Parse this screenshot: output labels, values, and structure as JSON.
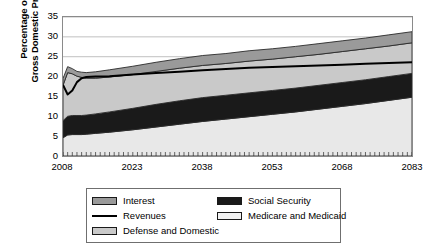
{
  "chart_data": {
    "type": "area",
    "stacked": true,
    "title": "",
    "xlabel": "",
    "ylabel": "Percentage of Gross Domestic Product",
    "ylabel_line1": "Percentage of",
    "ylabel_line2": "Gross Domestic Product",
    "xlim": [
      2008,
      2083
    ],
    "ylim": [
      0,
      35
    ],
    "yticks": [
      0,
      5,
      10,
      15,
      20,
      25,
      30,
      35
    ],
    "ytick_labels": [
      "0",
      "5",
      "10",
      "15",
      "20",
      "25",
      "30",
      "35"
    ],
    "xticks": [
      2008,
      2023,
      2038,
      2053,
      2068,
      2083
    ],
    "xtick_labels": [
      "2008",
      "2023",
      "2038",
      "2053",
      "2068",
      "2083"
    ],
    "minor_xtick_interval": 1,
    "grid": "horizontal",
    "legend_position": "bottom",
    "colors": {
      "medicare_and_medicaid": "#e8e8e8",
      "social_security": "#1a1a1a",
      "defense_and_domestic": "#c9c9c9",
      "interest": "#9a9a9a",
      "revenues_line": "#000000",
      "gridline": "#c0c0c0",
      "axis": "#8a8a8a"
    },
    "x": [
      2008,
      2009,
      2010,
      2011,
      2012,
      2013,
      2015,
      2018,
      2023,
      2028,
      2033,
      2038,
      2043,
      2048,
      2053,
      2058,
      2063,
      2068,
      2073,
      2078,
      2083
    ],
    "series": [
      {
        "name": "Medicare and Medicaid",
        "order": 1,
        "values": [
          4.6,
          5.3,
          5.4,
          5.4,
          5.4,
          5.5,
          5.7,
          6.0,
          6.6,
          7.3,
          8.0,
          8.7,
          9.3,
          9.9,
          10.5,
          11.1,
          11.8,
          12.5,
          13.2,
          14.0,
          14.8
        ]
      },
      {
        "name": "Social Security",
        "order": 2,
        "values": [
          4.3,
          4.7,
          4.8,
          4.8,
          4.8,
          4.8,
          4.9,
          5.1,
          5.4,
          5.7,
          5.9,
          6.0,
          6.0,
          6.0,
          6.0,
          6.0,
          6.0,
          6.0,
          6.0,
          6.0,
          6.0
        ]
      },
      {
        "name": "Defense and Domestic",
        "order": 3,
        "values": [
          8.9,
          11.0,
          10.5,
          9.9,
          9.6,
          9.3,
          9.0,
          8.8,
          8.5,
          8.3,
          8.2,
          8.1,
          8.0,
          8.0,
          7.9,
          7.9,
          7.8,
          7.8,
          7.8,
          7.7,
          7.7
        ]
      },
      {
        "name": "Interest",
        "order": 4,
        "values": [
          1.7,
          1.5,
          1.3,
          1.2,
          1.3,
          1.4,
          1.6,
          1.8,
          2.1,
          2.3,
          2.4,
          2.5,
          2.5,
          2.6,
          2.6,
          2.6,
          2.7,
          2.7,
          2.7,
          2.8,
          2.8
        ]
      }
    ],
    "line_series": [
      {
        "name": "Revenues",
        "x": [
          2008,
          2009,
          2010,
          2011,
          2012,
          2013,
          2015,
          2018,
          2023,
          2028,
          2033,
          2038,
          2043,
          2048,
          2053,
          2058,
          2063,
          2068,
          2073,
          2078,
          2083
        ],
        "values": [
          17.9,
          15.5,
          16.5,
          18.6,
          19.6,
          19.9,
          20.0,
          20.1,
          20.5,
          20.9,
          21.2,
          21.6,
          21.9,
          22.2,
          22.4,
          22.6,
          22.8,
          23.0,
          23.2,
          23.4,
          23.6
        ]
      }
    ],
    "stack_top_note": "Total spending peaks near 27.5 percent of GDP in 2009 and rises to about 25.3 percent by 2083",
    "legend": {
      "left_column": [
        {
          "label": "Interest",
          "marker": "swatch",
          "color": "#9a9a9a"
        },
        {
          "label": "Revenues",
          "marker": "line",
          "color": "#000000"
        },
        {
          "label": "Defense and Domestic",
          "marker": "swatch",
          "color": "#c9c9c9"
        }
      ],
      "right_column": [
        {
          "label": "Social Security",
          "marker": "swatch",
          "color": "#1a1a1a"
        },
        {
          "label": "Medicare and Medicaid",
          "marker": "swatch",
          "color": "#f2f2f2"
        }
      ]
    }
  }
}
